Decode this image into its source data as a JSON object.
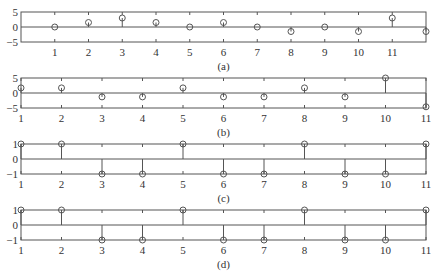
{
  "chart_data": [
    {
      "type": "stem",
      "caption": "(a)",
      "x": [
        1,
        2,
        3,
        4,
        5,
        6,
        7,
        8,
        9,
        10,
        11,
        12
      ],
      "values": [
        0,
        1.5,
        3,
        1.5,
        0,
        1.5,
        0,
        -1.5,
        0,
        -1.5,
        3,
        -1.5
      ],
      "xlim": [
        0,
        12
      ],
      "ylim": [
        -5,
        5
      ],
      "xticks": [
        1,
        2,
        3,
        4,
        5,
        6,
        7,
        8,
        9,
        10,
        11
      ],
      "xtick_labels": [
        "1",
        "2",
        "3",
        "4",
        "5",
        "6",
        "7",
        "8",
        "9",
        "10",
        "11"
      ],
      "yticks": [
        -5,
        0,
        5
      ],
      "ytick_labels": [
        "-5",
        "0",
        "5"
      ],
      "grid": false,
      "marker": "open-circle"
    },
    {
      "type": "stem",
      "caption": "(b)",
      "x": [
        1,
        2,
        3,
        4,
        5,
        6,
        7,
        8,
        9,
        10,
        11
      ],
      "values": [
        1.7,
        1.7,
        -1.3,
        -1.3,
        1.7,
        -1.3,
        -1.3,
        1.7,
        -1.3,
        5,
        -4.6
      ],
      "xlim": [
        1,
        11
      ],
      "ylim": [
        -5,
        5
      ],
      "xticks": [
        1,
        2,
        3,
        4,
        5,
        6,
        7,
        8,
        9,
        10,
        11
      ],
      "xtick_labels": [
        "1",
        "2",
        "3",
        "4",
        "5",
        "6",
        "7",
        "8",
        "9",
        "10",
        "11"
      ],
      "yticks": [
        -5,
        0,
        5
      ],
      "ytick_labels": [
        "-5",
        "0",
        "5"
      ],
      "grid": false,
      "marker": "open-circle"
    },
    {
      "type": "stem",
      "caption": "(c)",
      "x": [
        1,
        2,
        3,
        4,
        5,
        6,
        7,
        8,
        9,
        10,
        11
      ],
      "values": [
        1,
        1,
        -1,
        -1,
        1,
        -1,
        -1,
        1,
        -1,
        -1,
        1
      ],
      "xlim": [
        1,
        11
      ],
      "ylim": [
        -1,
        1
      ],
      "xticks": [
        1,
        2,
        3,
        4,
        5,
        6,
        7,
        8,
        9,
        10,
        11
      ],
      "xtick_labels": [
        "1",
        "2",
        "3",
        "4",
        "5",
        "6",
        "7",
        "8",
        "9",
        "10",
        "11"
      ],
      "yticks": [
        -1,
        0,
        1
      ],
      "ytick_labels": [
        "-1",
        "0",
        "1"
      ],
      "grid": false,
      "marker": "open-circle"
    },
    {
      "type": "stem",
      "caption": "(d)",
      "x": [
        1,
        2,
        3,
        4,
        5,
        6,
        7,
        8,
        9,
        10,
        11
      ],
      "values": [
        1,
        1,
        -1,
        -1,
        1,
        -1,
        -1,
        1,
        -1,
        -1,
        1
      ],
      "xlim": [
        1,
        11
      ],
      "ylim": [
        -1,
        1
      ],
      "xticks": [
        1,
        2,
        3,
        4,
        5,
        6,
        7,
        8,
        9,
        10,
        11
      ],
      "xtick_labels": [
        "1",
        "2",
        "3",
        "4",
        "5",
        "6",
        "7",
        "8",
        "9",
        "10",
        "11"
      ],
      "yticks": [
        -1,
        0,
        1
      ],
      "ytick_labels": [
        "-1",
        "0",
        "1"
      ],
      "grid": false,
      "marker": "open-circle"
    }
  ],
  "layout": {
    "panels": [
      {
        "left": 21,
        "right": 426,
        "top": 12,
        "bottom": 42,
        "tick_label_y": 56,
        "caption_y": 70
      },
      {
        "left": 21,
        "right": 426,
        "top": 78,
        "bottom": 108,
        "tick_label_y": 122,
        "caption_y": 136
      },
      {
        "left": 21,
        "right": 426,
        "top": 144,
        "bottom": 174,
        "tick_label_y": 188,
        "caption_y": 202
      },
      {
        "left": 21,
        "right": 426,
        "top": 210,
        "bottom": 240,
        "tick_label_y": 254,
        "caption_y": 268
      }
    ]
  }
}
